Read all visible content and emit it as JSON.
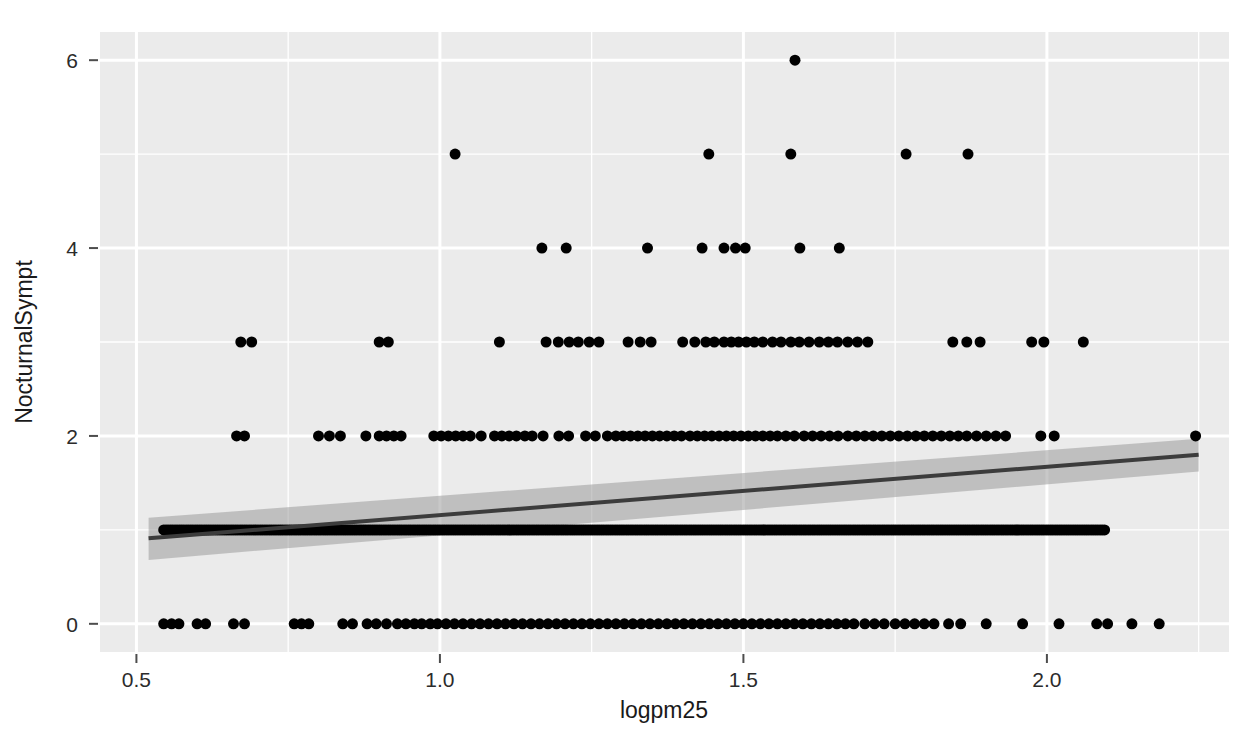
{
  "chart_data": {
    "type": "scatter",
    "title": "",
    "xlabel": "logpm25",
    "ylabel": "NocturnalSympt",
    "xlim": [
      0.44,
      2.3
    ],
    "ylim": [
      -0.3,
      6.3
    ],
    "xticks": [
      0.5,
      1.0,
      1.5,
      2.0
    ],
    "xtick_labels": [
      "0.5",
      "1.0",
      "1.5",
      "2.0"
    ],
    "yticks": [
      0,
      2,
      4,
      6
    ],
    "ytick_labels": [
      "0",
      "2",
      "4",
      "6"
    ],
    "minor_xticks": [
      0.75,
      1.25,
      1.75,
      2.25
    ],
    "minor_yticks": [
      1,
      3,
      5
    ],
    "grid": true,
    "grid_color": "#ffffff",
    "panel_background": "#ebebeb",
    "point_color": "#000000",
    "point_size": 5.5,
    "legend": null,
    "annotations": [],
    "smooth": {
      "method": "lm",
      "line_color": "#3c3c3c",
      "band_color": "#9a9a9a",
      "band_opacity": 0.55,
      "x_start": 0.52,
      "x_end": 2.25,
      "y_start": 0.91,
      "y_end": 1.8,
      "band_lower_start": 0.68,
      "band_upper_start": 1.13,
      "band_lower_end": 1.62,
      "band_upper_end": 1.97
    },
    "series": [
      {
        "name": "observations",
        "points_y6": [
          1.585
        ],
        "points_y5": [
          1.025,
          1.443,
          1.578,
          1.768,
          1.87
        ],
        "points_y4": [
          1.168,
          1.208,
          1.342,
          1.432,
          1.468,
          1.487,
          1.503,
          1.593,
          1.658
        ],
        "points_y3": [
          0.672,
          0.69,
          0.9,
          0.915,
          1.098,
          1.175,
          1.195,
          1.213,
          1.228,
          1.246,
          1.262,
          1.31,
          1.33,
          1.348,
          1.4,
          1.42,
          1.438,
          1.452,
          1.468,
          1.48,
          1.492,
          1.505,
          1.518,
          1.532,
          1.548,
          1.562,
          1.578,
          1.592,
          1.608,
          1.625,
          1.64,
          1.655,
          1.672,
          1.688,
          1.705,
          1.845,
          1.868,
          1.89,
          1.975,
          1.995,
          2.06
        ],
        "points_y2": [
          0.665,
          0.678,
          0.8,
          0.818,
          0.836,
          0.878,
          0.9,
          0.912,
          0.924,
          0.936,
          0.99,
          1.002,
          1.014,
          1.026,
          1.038,
          1.05,
          1.068,
          1.09,
          1.102,
          1.114,
          1.126,
          1.14,
          1.152,
          1.17,
          1.196,
          1.212,
          1.24,
          1.256,
          1.276,
          1.29,
          1.302,
          1.314,
          1.326,
          1.338,
          1.35,
          1.362,
          1.374,
          1.386,
          1.398,
          1.412,
          1.424,
          1.436,
          1.448,
          1.46,
          1.472,
          1.484,
          1.496,
          1.508,
          1.52,
          1.532,
          1.544,
          1.556,
          1.57,
          1.584,
          1.6,
          1.614,
          1.628,
          1.642,
          1.656,
          1.672,
          1.686,
          1.7,
          1.714,
          1.728,
          1.742,
          1.756,
          1.77,
          1.784,
          1.798,
          1.812,
          1.826,
          1.84,
          1.854,
          1.868,
          1.884,
          1.9,
          1.916,
          1.932,
          1.99,
          2.012,
          2.245
        ],
        "points_y1_start": 0.545,
        "points_y1_end": 2.095,
        "points_y1_count": 420,
        "points_y0": [
          0.545,
          0.558,
          0.57,
          0.6,
          0.614,
          0.66,
          0.678,
          0.76,
          0.772,
          0.784,
          0.84,
          0.856,
          0.88,
          0.895,
          0.912,
          0.93,
          0.944,
          0.958,
          0.97,
          0.984,
          0.996,
          1.01,
          1.024,
          1.038,
          1.052,
          1.066,
          1.08,
          1.094,
          1.108,
          1.122,
          1.136,
          1.15,
          1.164,
          1.178,
          1.192,
          1.206,
          1.22,
          1.234,
          1.248,
          1.262,
          1.276,
          1.29,
          1.304,
          1.318,
          1.332,
          1.346,
          1.36,
          1.374,
          1.388,
          1.402,
          1.416,
          1.43,
          1.444,
          1.458,
          1.472,
          1.486,
          1.5,
          1.514,
          1.528,
          1.542,
          1.556,
          1.57,
          1.584,
          1.598,
          1.612,
          1.626,
          1.64,
          1.654,
          1.668,
          1.682,
          1.7,
          1.716,
          1.732,
          1.75,
          1.766,
          1.782,
          1.798,
          1.814,
          1.838,
          1.858,
          1.9,
          1.96,
          2.02,
          2.082,
          2.1,
          2.14,
          2.185
        ]
      }
    ]
  },
  "panel": {
    "left": 100,
    "top": 32,
    "right": 1229,
    "bottom": 652
  }
}
